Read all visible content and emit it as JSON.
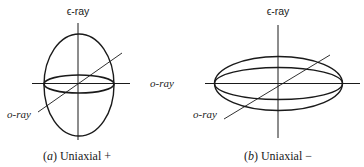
{
  "panels": [
    {
      "id": "a",
      "top_label": "ϵ-ray",
      "side_label": "o-ray",
      "diagonal_label": "o-ray",
      "caption_letter": "a",
      "caption_text": "Uniaxial +"
    },
    {
      "id": "b",
      "top_label": "ϵ-ray",
      "side_label": "o-ray",
      "diagonal_label": "o-ray",
      "caption_letter": "b",
      "caption_text": "Uniaxial −"
    }
  ],
  "colors": {
    "stroke": "#1a1a1a",
    "background": "#ffffff"
  }
}
